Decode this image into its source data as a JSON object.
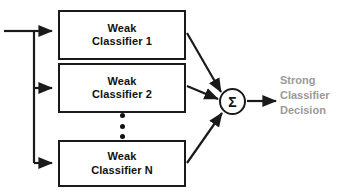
{
  "diagram": {
    "background_color": "#ffffff",
    "line_color": "#1a1a1a",
    "box_text_color": "#111111",
    "output_text_color": "#9a9a9a"
  },
  "nodes": {
    "weak_1": {
      "line1": "Weak",
      "line2": "Classifier 1"
    },
    "weak_2": {
      "line1": "Weak",
      "line2": "Classifier 2"
    },
    "weak_n": {
      "line1": "Weak",
      "line2": "Classifier N"
    },
    "sum": {
      "symbol": "Σ"
    }
  },
  "output": {
    "line1": "Strong",
    "line2": "Classifier",
    "line3": "Decision"
  },
  "ellipsis": {
    "dot_count": 3
  },
  "edges": [
    {
      "name": "input-to-bus",
      "from": "input",
      "to": "bus"
    },
    {
      "name": "bus-to-weak-1",
      "from": "bus",
      "to": "weak_1"
    },
    {
      "name": "bus-to-weak-2",
      "from": "bus",
      "to": "weak_2"
    },
    {
      "name": "bus-to-weak-n",
      "from": "bus",
      "to": "weak_n"
    },
    {
      "name": "weak-1-to-sum",
      "from": "weak_1",
      "to": "sum"
    },
    {
      "name": "weak-2-to-sum",
      "from": "weak_2",
      "to": "sum"
    },
    {
      "name": "weak-n-to-sum",
      "from": "weak_n",
      "to": "sum"
    },
    {
      "name": "sum-to-output",
      "from": "sum",
      "to": "output"
    }
  ]
}
